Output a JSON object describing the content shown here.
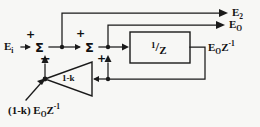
{
  "figure": {
    "kind": "signal-flow-block-diagram",
    "width": 260,
    "height": 127,
    "background_color": "#f7f7f5",
    "line_color": "#1a1a1a"
  },
  "signals": {
    "input_label": "E",
    "input_sub": "i",
    "output_e2_label": "E",
    "output_e2_sub": "2",
    "output_e0_label": "E",
    "output_e0_sub": "O",
    "delayed_output_label": "E",
    "delayed_output_sub": "O",
    "delayed_output_base": "Z",
    "delayed_output_exp": "-1",
    "feedback_label_prefix": "(1-k) E",
    "feedback_label_sub": "O",
    "feedback_label_base": "Z",
    "feedback_label_exp": "-1"
  },
  "summers": [
    {
      "id": "summing-junction-1",
      "glyph": "Σ",
      "cx": 40,
      "cy": 47,
      "r": 9,
      "signs": [
        {
          "text": "+",
          "x": 25,
          "y": 33,
          "size": 11
        },
        {
          "text": "−",
          "x": 40,
          "y": 57,
          "size": 12
        }
      ]
    },
    {
      "id": "summing-junction-2",
      "glyph": "Σ",
      "cx": 90,
      "cy": 47,
      "r": 9,
      "signs": [
        {
          "text": "+",
          "x": 76,
          "y": 32,
          "size": 11
        },
        {
          "text": "+",
          "x": 96,
          "y": 57,
          "size": 11
        }
      ]
    }
  ],
  "blocks": {
    "delay": {
      "id": "unit-delay-block",
      "numerator": "1",
      "slash": "/",
      "denominator": "Z",
      "x": 130,
      "y": 32,
      "w": 60,
      "h": 31
    },
    "gain": {
      "id": "gain-triangle",
      "label": "1-k",
      "apex_x": 45,
      "apex_y": 79,
      "base_x": 92,
      "top_y": 62,
      "bottom_y": 96
    }
  },
  "nodes": [
    {
      "name": "node-after-summer-1",
      "x": 62,
      "y": 47
    },
    {
      "name": "node-after-summer-2",
      "x": 108,
      "y": 47
    },
    {
      "name": "node-feedback-tap",
      "x": 108,
      "y": 79
    },
    {
      "name": "node-gain-input",
      "x": 45,
      "y": 79
    }
  ],
  "labels": {
    "input": {
      "x": 6,
      "y": 41
    },
    "e2": {
      "x": 232,
      "y": 8
    },
    "e0": {
      "x": 229,
      "y": 21
    },
    "delayed": {
      "x": 208,
      "y": 41
    },
    "feedback": {
      "x": 10,
      "y": 104
    },
    "gain": {
      "x": 63,
      "y": 74
    }
  }
}
